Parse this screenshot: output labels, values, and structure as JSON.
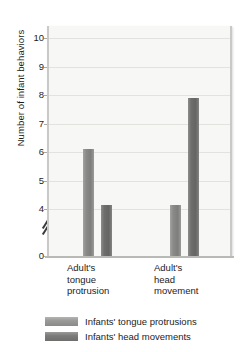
{
  "chart_data": {
    "type": "bar",
    "title": "",
    "xlabel": "",
    "ylabel": "Number of infant behaviors",
    "categories": [
      "Adult's tongue protrusion",
      "Adult's head movement"
    ],
    "category_lines": [
      [
        "Adult's",
        "tongue",
        "protrusion"
      ],
      [
        "Adult's",
        "head",
        "movement"
      ]
    ],
    "series": [
      {
        "name": "Infants' tongue protrusions",
        "color": "#8a8a88",
        "values": [
          6.1,
          4.15
        ]
      },
      {
        "name": "Infants' head movements",
        "color": "#6e6e6c",
        "values": [
          4.15,
          7.9
        ]
      }
    ],
    "ylim": [
      0,
      10
    ],
    "y_axis_break": true,
    "y_axis_break_between": [
      0,
      4
    ],
    "yticks": [
      0,
      4,
      5,
      6,
      7,
      8,
      9,
      10
    ],
    "ytick_labels": [
      "0",
      "4",
      "5",
      "6",
      "7",
      "8",
      "9",
      "10"
    ],
    "grid": true,
    "grid_axis": "y",
    "legend_position": "bottom-left",
    "plot_background": "#f7f7f5",
    "gridline_color": "#e2e2df"
  }
}
